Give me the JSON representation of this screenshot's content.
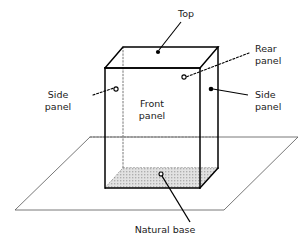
{
  "figure": {
    "type": "line-diagram",
    "background_color": "#ffffff",
    "line_color": "#000000",
    "ground_line_color": "#555555",
    "hidden_line_style": "dotted",
    "base_fill": "#d9d9d9"
  },
  "labels": {
    "top": {
      "text": "Top",
      "lines": [
        "Top"
      ],
      "x": 186,
      "y": 17
    },
    "rear_panel": {
      "text": "Rear panel",
      "lines": [
        "Rear",
        "panel"
      ],
      "x": 255,
      "y": 52
    },
    "side_panel_left": {
      "text": "Side panel",
      "lines": [
        "Side",
        "panel"
      ],
      "x": 58,
      "y": 98
    },
    "side_panel_right": {
      "text": "Side panel",
      "lines": [
        "Side",
        "panel"
      ],
      "x": 255,
      "y": 98
    },
    "front_panel": {
      "text": "Front panel",
      "lines": [
        "Front",
        "panel"
      ],
      "x": 152,
      "y": 107
    },
    "natural_base": {
      "text": "Natural base",
      "lines": [
        "Natural base"
      ],
      "x": 165,
      "y": 232
    }
  },
  "markers": {
    "top_dot": {
      "kind": "filled-dot",
      "x": 158,
      "y": 52
    },
    "rear_panel_dot": {
      "kind": "open-circle",
      "x": 184,
      "y": 77
    },
    "side_panel_left_dot": {
      "kind": "open-circle",
      "x": 116,
      "y": 89
    },
    "side_panel_right_dot": {
      "kind": "filled-dot",
      "x": 211,
      "y": 89
    },
    "natural_base_dot": {
      "kind": "open-circle",
      "x": 161,
      "y": 174
    }
  },
  "geometry": {
    "box": {
      "front_top_left": {
        "x": 105,
        "y": 68
      },
      "front_top_right": {
        "x": 200,
        "y": 68
      },
      "front_bot_left": {
        "x": 105,
        "y": 188
      },
      "front_bot_right": {
        "x": 200,
        "y": 188
      },
      "back_top_left": {
        "x": 123,
        "y": 47
      },
      "back_top_right": {
        "x": 218,
        "y": 47
      },
      "back_bot_left": {
        "x": 123,
        "y": 168
      },
      "back_bot_right": {
        "x": 218,
        "y": 168
      }
    },
    "ground_plane": {
      "left": {
        "x": 15,
        "y": 210
      },
      "top": {
        "x": 90,
        "y": 137
      },
      "right": {
        "x": 298,
        "y": 137
      },
      "bottom": {
        "x": 224,
        "y": 210
      }
    }
  },
  "leader_lines": {
    "top": {
      "from": {
        "x": 181,
        "y": 22
      },
      "to": {
        "x": 159,
        "y": 50
      }
    },
    "rear_panel": {
      "from": {
        "x": 249,
        "y": 53
      },
      "to": {
        "x": 186,
        "y": 77
      },
      "style": "dotted"
    },
    "side_panel_left": {
      "from": {
        "x": 93,
        "y": 95
      },
      "to": {
        "x": 114,
        "y": 88
      },
      "style": "dotted"
    },
    "side_panel_right": {
      "from": {
        "x": 248,
        "y": 95
      },
      "to": {
        "x": 213,
        "y": 89
      }
    },
    "natural_base": {
      "from": {
        "x": 190,
        "y": 222
      },
      "to": {
        "x": 162,
        "y": 176
      }
    }
  }
}
